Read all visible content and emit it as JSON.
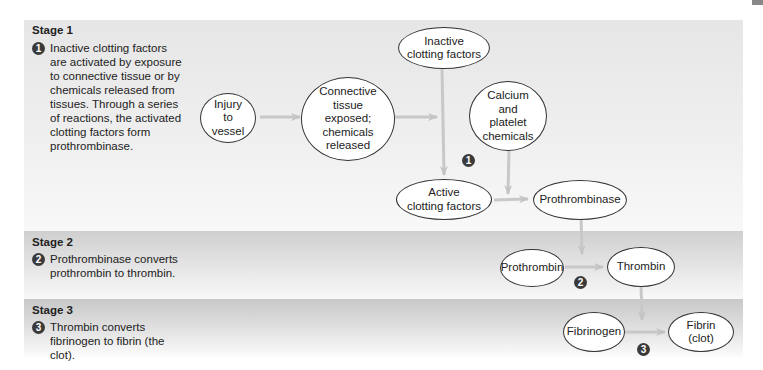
{
  "stages": [
    {
      "title": "Stage 1",
      "number": "1",
      "text": [
        "Inactive clotting factors",
        "are activated by exposure",
        "to connective tissue or by",
        "chemicals released from",
        "tissues. Through a series",
        "of reactions, the activated",
        "clotting factors form",
        "prothrombinase."
      ]
    },
    {
      "title": "Stage 2",
      "number": "2",
      "text": [
        "Prothrombinase converts",
        "prothrombin to thrombin."
      ]
    },
    {
      "title": "Stage 3",
      "number": "3",
      "text": [
        "Thrombin converts",
        "fibrinogen to fibrin (the",
        "clot)."
      ]
    }
  ],
  "nodes": {
    "injury": "Injury\nto\nvessel",
    "connective": "Connective\ntissue\nexposed;\nchemicals\nreleased",
    "inactive": "Inactive\nclotting factors",
    "calcium": "Calcium\nand\nplatelet\nchemicals",
    "active": "Active\nclotting factors",
    "prothrombinase": "Prothrombinase",
    "prothrombin": "Prothrombin",
    "thrombin": "Thrombin",
    "fibrinogen": "Fibrinogen",
    "fibrin": "Fibrin\n(clot)"
  },
  "step_markers": [
    "1",
    "2",
    "3"
  ],
  "colors": {
    "arrow": "#c4c4c4",
    "marker": "#3a3a3a",
    "node_border": "#333333"
  }
}
